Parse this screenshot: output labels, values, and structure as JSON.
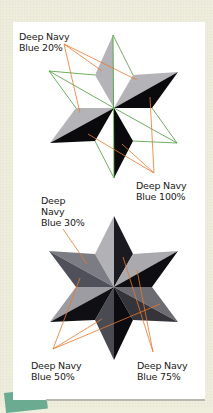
{
  "colors": {
    "background": "#efeedd",
    "card": "#ffffff",
    "leader_line": "#e8782c",
    "outline": "#4a9a3a",
    "accent_tab": "#6aab92"
  },
  "top_figure": {
    "description": "Wireframe star showing filled facets",
    "labels": [
      {
        "id": "tint20",
        "text": "Deep Navy\nBlue 20%"
      },
      {
        "id": "tint100",
        "text": "Deep Navy\nBlue 100%"
      }
    ]
  },
  "bottom_figure": {
    "description": "Fully shaded beveled star",
    "labels": [
      {
        "id": "tint30",
        "text": "Deep\nNavy\nBlue 30%"
      },
      {
        "id": "tint50",
        "text": "Deep Navy\nBlue 50%"
      },
      {
        "id": "tint75",
        "text": "Deep Navy\nBlue 75%"
      }
    ]
  }
}
